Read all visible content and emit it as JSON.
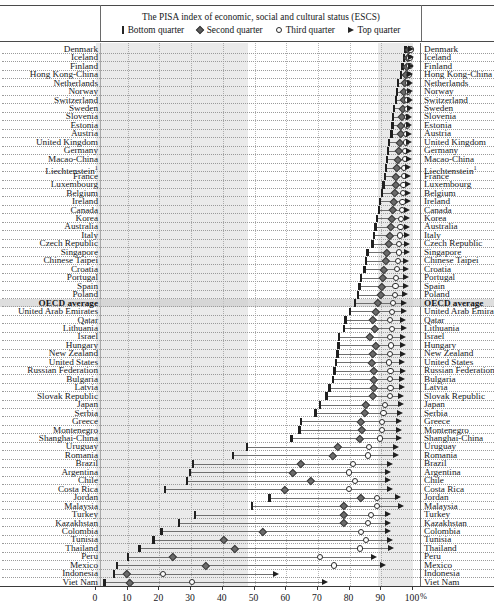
{
  "chart_data": {
    "type": "scatter",
    "title": "The PISA index of economic, social and cultural status (ESCS)",
    "xlabel": "%",
    "ylabel": "",
    "xlim": [
      0,
      100
    ],
    "xticks": [
      0,
      10,
      20,
      30,
      40,
      50,
      60,
      70,
      80,
      90,
      100
    ],
    "x_unit_label": "%",
    "grid": true,
    "legend": [
      "Bottom quarter",
      "Second quarter",
      "Third quarter",
      "Top quarter"
    ],
    "legend_position": "top",
    "series": [
      {
        "name": "Bottom quarter",
        "marker": "bar"
      },
      {
        "name": "Second quarter",
        "marker": "diamond"
      },
      {
        "name": "Third quarter",
        "marker": "circle"
      },
      {
        "name": "Top quarter",
        "marker": "triangle"
      }
    ],
    "shaded_bands": [
      [
        0,
        48
      ],
      [
        89,
        100
      ]
    ],
    "highlight_row": "OECD average",
    "footnote_marker": "1",
    "categories": [
      "Denmark",
      "Iceland",
      "Finland",
      "Hong Kong-China",
      "Netherlands",
      "Norway",
      "Switzerland",
      "Sweden",
      "Slovenia",
      "Estonia",
      "Austria",
      "United Kingdom",
      "Germany",
      "Macao-China",
      "Liechtenstein",
      "France",
      "Luxembourg",
      "Belgium",
      "Ireland",
      "Canada",
      "Korea",
      "Australia",
      "Italy",
      "Czech Republic",
      "Singapore",
      "Chinese Taipei",
      "Croatia",
      "Portugal",
      "Spain",
      "Poland",
      "OECD average",
      "United Arab Emirates",
      "Qatar",
      "Lithuania",
      "Israel",
      "Hungary",
      "New Zealand",
      "United States",
      "Russian Federation",
      "Bulgaria",
      "Latvia",
      "Slovak Republic",
      "Japan",
      "Serbia",
      "Greece",
      "Montenegro",
      "Shanghai-China",
      "Uruguay",
      "Romania",
      "Brazil",
      "Argentina",
      "Chile",
      "Costa Rica",
      "Jordan",
      "Malaysia",
      "Turkey",
      "Kazakhstan",
      "Colombia",
      "Tunisia",
      "Thailand",
      "Peru",
      "Mexico",
      "Indonesia",
      "Viet Nam"
    ],
    "rows": [
      {
        "label": "Denmark",
        "bottom": 98.0,
        "second": 99.0,
        "third": 99.5,
        "top": 99.8
      },
      {
        "label": "Iceland",
        "bottom": 97.5,
        "second": 98.6,
        "third": 99.2,
        "top": 99.6
      },
      {
        "label": "Finland",
        "bottom": 97.0,
        "second": 98.4,
        "third": 99.2,
        "top": 99.6
      },
      {
        "label": "Hong Kong-China",
        "bottom": 96.5,
        "second": 98.0,
        "third": 99.0,
        "top": 99.5
      },
      {
        "label": "Netherlands",
        "bottom": 95.5,
        "second": 97.6,
        "third": 98.8,
        "top": 99.4
      },
      {
        "label": "Norway",
        "bottom": 95.3,
        "second": 97.5,
        "third": 98.7,
        "top": 99.4
      },
      {
        "label": "Switzerland",
        "bottom": 95.0,
        "second": 97.3,
        "third": 98.6,
        "top": 99.3
      },
      {
        "label": "Sweden",
        "bottom": 94.3,
        "second": 97.0,
        "third": 98.5,
        "top": 99.3
      },
      {
        "label": "Slovenia",
        "bottom": 94.0,
        "second": 96.8,
        "third": 98.4,
        "top": 99.2
      },
      {
        "label": "Estonia",
        "bottom": 93.8,
        "second": 96.6,
        "third": 98.3,
        "top": 99.2
      },
      {
        "label": "Austria",
        "bottom": 93.5,
        "second": 96.4,
        "third": 98.2,
        "top": 99.1
      },
      {
        "label": "United Kingdom",
        "bottom": 92.8,
        "second": 96.0,
        "third": 98.0,
        "top": 99.1
      },
      {
        "label": "Germany",
        "bottom": 92.5,
        "second": 95.8,
        "third": 97.9,
        "top": 99.0
      },
      {
        "label": "Macao-China",
        "bottom": 92.2,
        "second": 95.6,
        "third": 97.8,
        "top": 99.0
      },
      {
        "label": "Liechtenstein",
        "bottom": 91.8,
        "second": 95.3,
        "third": 97.6,
        "top": 98.9
      },
      {
        "label": "France",
        "bottom": 91.5,
        "second": 95.0,
        "third": 97.5,
        "top": 98.9
      },
      {
        "label": "Luxembourg",
        "bottom": 91.0,
        "second": 94.8,
        "third": 97.3,
        "top": 98.8
      },
      {
        "label": "Belgium",
        "bottom": 90.5,
        "second": 94.5,
        "third": 97.2,
        "top": 98.8
      },
      {
        "label": "Ireland",
        "bottom": 90.0,
        "second": 94.2,
        "third": 97.0,
        "top": 98.7
      },
      {
        "label": "Canada",
        "bottom": 89.5,
        "second": 94.0,
        "third": 96.8,
        "top": 98.6
      },
      {
        "label": "Korea",
        "bottom": 89.0,
        "second": 93.6,
        "third": 96.6,
        "top": 98.6
      },
      {
        "label": "Australia",
        "bottom": 88.5,
        "second": 93.3,
        "third": 96.4,
        "top": 98.5
      },
      {
        "label": "Italy",
        "bottom": 88.0,
        "second": 93.0,
        "third": 96.2,
        "top": 98.4
      },
      {
        "label": "Czech Republic",
        "bottom": 87.5,
        "second": 92.6,
        "third": 96.0,
        "top": 98.4
      },
      {
        "label": "Singapore",
        "bottom": 86.0,
        "second": 92.0,
        "third": 95.8,
        "top": 98.3
      },
      {
        "label": "Chinese Taipei",
        "bottom": 85.5,
        "second": 91.6,
        "third": 95.5,
        "top": 98.2
      },
      {
        "label": "Croatia",
        "bottom": 85.0,
        "second": 91.2,
        "third": 95.3,
        "top": 98.1
      },
      {
        "label": "Portugal",
        "bottom": 84.0,
        "second": 90.8,
        "third": 95.0,
        "top": 98.0
      },
      {
        "label": "Spain",
        "bottom": 83.5,
        "second": 90.4,
        "third": 94.8,
        "top": 98.0
      },
      {
        "label": "Poland",
        "bottom": 83.0,
        "second": 90.0,
        "third": 94.6,
        "top": 97.9
      },
      {
        "label": "OECD average",
        "bottom": 82.0,
        "second": 89.3,
        "third": 94.0,
        "top": 97.6
      },
      {
        "label": "United Arab Emirates",
        "bottom": 80.5,
        "second": 88.6,
        "third": 93.6,
        "top": 97.4
      },
      {
        "label": "Qatar",
        "bottom": 79.0,
        "second": 87.5,
        "third": 93.0,
        "top": 97.2
      },
      {
        "label": "Lithuania",
        "bottom": 78.5,
        "second": 88.2,
        "third": 93.8,
        "top": 97.5
      },
      {
        "label": "Israel",
        "bottom": 77.0,
        "second": 86.8,
        "third": 93.0,
        "top": 97.3
      },
      {
        "label": "Hungary",
        "bottom": 76.8,
        "second": 88.5,
        "third": 93.5,
        "top": 97.3
      },
      {
        "label": "New Zealand",
        "bottom": 76.5,
        "second": 87.5,
        "third": 93.0,
        "top": 97.2
      },
      {
        "label": "United States",
        "bottom": 76.0,
        "second": 87.2,
        "third": 92.8,
        "top": 97.0
      },
      {
        "label": "Russian Federation",
        "bottom": 75.5,
        "second": 88.0,
        "third": 93.2,
        "top": 97.2
      },
      {
        "label": "Bulgaria",
        "bottom": 75.0,
        "second": 87.8,
        "third": 93.0,
        "top": 97.0
      },
      {
        "label": "Latvia",
        "bottom": 74.0,
        "second": 88.0,
        "third": 93.2,
        "top": 96.8
      },
      {
        "label": "Slovak Republic",
        "bottom": 73.0,
        "second": 87.5,
        "third": 93.0,
        "top": 96.6
      },
      {
        "label": "Japan",
        "bottom": 71.0,
        "second": 85.5,
        "third": 91.5,
        "top": 96.5
      },
      {
        "label": "Serbia",
        "bottom": 69.5,
        "second": 85.0,
        "third": 91.0,
        "top": 96.2
      },
      {
        "label": "Greece",
        "bottom": 65.0,
        "second": 84.0,
        "third": 90.5,
        "top": 96.0
      },
      {
        "label": "Montenegro",
        "bottom": 64.5,
        "second": 84.2,
        "third": 90.6,
        "top": 96.0
      },
      {
        "label": "Shanghai-China",
        "bottom": 62.0,
        "second": 83.5,
        "third": 90.0,
        "top": 95.8
      },
      {
        "label": "Uruguay",
        "bottom": 48.0,
        "second": 76.5,
        "third": 86.5,
        "top": 95.0
      },
      {
        "label": "Romania",
        "bottom": 43.5,
        "second": 75.0,
        "third": 86.0,
        "top": 95.0
      },
      {
        "label": "Brazil",
        "bottom": 31.0,
        "second": 65.0,
        "third": 81.5,
        "top": 93.0
      },
      {
        "label": "Argentina",
        "bottom": 30.0,
        "second": 62.5,
        "third": 80.0,
        "top": 92.5
      },
      {
        "label": "Chile",
        "bottom": 29.0,
        "second": 68.0,
        "third": 82.0,
        "top": 92.5
      },
      {
        "label": "Costa Rica",
        "bottom": 22.0,
        "second": 60.0,
        "third": 80.0,
        "top": 93.0
      },
      {
        "label": "Jordan",
        "bottom": 55.0,
        "second": 84.0,
        "third": 89.0,
        "top": 95.5
      },
      {
        "label": "Malaysia",
        "bottom": 49.5,
        "second": 78.5,
        "third": 89.0,
        "top": 96.5
      },
      {
        "label": "Turkey",
        "bottom": 31.5,
        "second": 78.5,
        "third": 87.0,
        "top": 92.5
      },
      {
        "label": "Kazakhstan",
        "bottom": 26.5,
        "second": 78.5,
        "third": 86.0,
        "top": 92.5
      },
      {
        "label": "Colombia",
        "bottom": 21.0,
        "second": 53.0,
        "third": 84.0,
        "top": 92.5
      },
      {
        "label": "Tunisia",
        "bottom": 18.5,
        "second": 40.5,
        "third": 85.5,
        "top": 93.0
      },
      {
        "label": "Thailand",
        "bottom": 14.0,
        "second": 44.0,
        "third": 83.5,
        "top": 93.5
      },
      {
        "label": "Peru",
        "bottom": 10.5,
        "second": 24.5,
        "third": 71.0,
        "top": 88.0
      },
      {
        "label": "Mexico",
        "bottom": 7.0,
        "second": 35.0,
        "third": 75.5,
        "top": 91.0
      },
      {
        "label": "Indonesia",
        "bottom": 6.0,
        "second": 10.0,
        "third": 21.5,
        "top": 57.0
      },
      {
        "label": "Viet Nam",
        "bottom": 3.0,
        "second": 11.0,
        "third": 30.5,
        "top": 72.5
      }
    ]
  }
}
